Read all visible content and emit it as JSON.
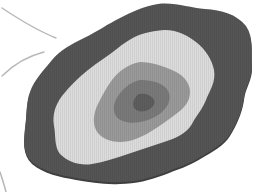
{
  "illustration": {
    "subject": "layered wavy blob with concentric contour bands",
    "colors": {
      "background": "#ffffff",
      "outer_band": "#555555",
      "outer_band_edge": "#3f3f3f",
      "light_band": "#dcdcdc",
      "mid_band": "#9a9a9a",
      "inner_band": "#7a7a7a",
      "core": "#5e5e5e",
      "arc_lines": "#b8b8b8"
    },
    "layers": [
      {
        "name": "outer-band",
        "path": "M158,4 C175,2 190,8 205,9 C222,10 236,14 246,26 C254,38 251,52 252,64 C253,78 245,86 244,98 C242,112 236,124 230,134 C224,144 212,150 202,156 C190,164 176,168 164,173 C150,178 136,182 120,182 C104,183 90,180 76,178 C60,175 44,172 32,162 C22,152 24,140 25,128 C27,114 26,102 30,92 C34,80 44,70 52,60 C60,50 72,44 84,38 C98,31 108,24 120,18 C132,12 144,6 158,4 Z"
      },
      {
        "name": "light-band",
        "path": "M165,30 C178,30 188,36 196,42 C206,50 212,60 214,70 C216,82 210,90 206,100 C202,110 196,116 192,124 C186,134 176,138 164,142 C152,146 140,150 128,154 C116,158 104,162 92,164 C80,166 68,162 60,154 C54,146 56,136 54,126 C52,114 56,104 62,96 C70,86 78,78 88,70 C98,62 108,56 118,48 C128,40 138,34 150,32 C155,31 160,30 165,30 Z"
      },
      {
        "name": "mid-band",
        "path": "M140,62 C152,62 162,66 172,70 C182,74 190,82 190,92 C190,102 184,108 176,114 C168,120 160,126 150,132 C140,138 130,142 120,142 C110,142 100,138 96,130 C92,122 94,112 98,104 C102,96 106,88 112,80 C118,72 128,64 140,62 Z"
      },
      {
        "name": "inner-band",
        "path": "M140,80 C150,80 160,82 166,88 C172,94 170,104 164,110 C158,116 150,120 140,122 C130,124 120,122 116,116 C112,110 114,102 118,96 C122,90 130,82 140,80 Z"
      },
      {
        "name": "core",
        "path": "M140,94 C146,93 152,96 154,100 C156,104 152,108 148,110 C144,112 138,112 135,109 C132,106 133,100 136,97 C137,95 138,94 140,94 Z"
      }
    ],
    "arcs": [
      {
        "name": "upper-arc",
        "path": "M2,8 C20,20 36,30 56,38"
      },
      {
        "name": "lower-arc",
        "path": "M44,52 C28,56 14,64 2,76"
      },
      {
        "name": "bottom-arc",
        "path": "M0,172 C2,178 4,184 6,192"
      }
    ]
  }
}
